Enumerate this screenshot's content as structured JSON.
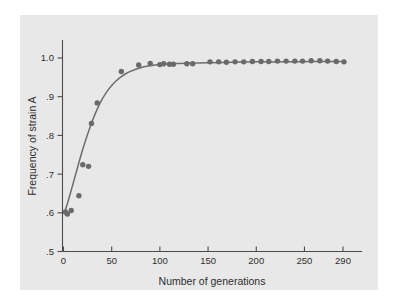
{
  "figure": {
    "background_color": "#ffffff",
    "panel_color": "#e8e8e8",
    "axis_color": "#4a4a4a",
    "point_color": "#6a6a6a",
    "curve_color": "#6d6d6d"
  },
  "chart_data": {
    "type": "scatter",
    "title": "",
    "subtitle": "",
    "xlabel": "Number of generations",
    "ylabel": "Frequency of strain A",
    "xlim": [
      0,
      300
    ],
    "ylim": [
      0.5,
      1.02
    ],
    "grid": false,
    "legend": null,
    "x_ticks": [
      0,
      50,
      100,
      150,
      200,
      250,
      290
    ],
    "x_tick_labels": [
      "0",
      "50",
      "100",
      "150",
      "200",
      "250",
      "290"
    ],
    "y_ticks": [
      0.5,
      0.6,
      0.7,
      0.8,
      0.9,
      1.0
    ],
    "y_tick_labels": [
      ".5",
      ".6",
      ".7",
      ".8",
      ".9",
      "1.0"
    ],
    "series": [
      {
        "name": "observed frequency",
        "marker": "circle",
        "color": "#6a6a6a",
        "points": [
          [
            2,
            0.602
          ],
          [
            4,
            0.597
          ],
          [
            8,
            0.606
          ],
          [
            16,
            0.644
          ],
          [
            20,
            0.724
          ],
          [
            26,
            0.72
          ],
          [
            29,
            0.831
          ],
          [
            35,
            0.884
          ],
          [
            60,
            0.965
          ],
          [
            78,
            0.982
          ],
          [
            90,
            0.986
          ],
          [
            100,
            0.983
          ],
          [
            104,
            0.985
          ],
          [
            110,
            0.984
          ],
          [
            114,
            0.984
          ],
          [
            128,
            0.985
          ],
          [
            134,
            0.985
          ],
          [
            152,
            0.99
          ],
          [
            161,
            0.99
          ],
          [
            169,
            0.989
          ],
          [
            178,
            0.99
          ],
          [
            187,
            0.99
          ],
          [
            196,
            0.991
          ],
          [
            205,
            0.991
          ],
          [
            213,
            0.991
          ],
          [
            222,
            0.992
          ],
          [
            231,
            0.992
          ],
          [
            240,
            0.992
          ],
          [
            248,
            0.992
          ],
          [
            257,
            0.993
          ],
          [
            266,
            0.993
          ],
          [
            274,
            0.992
          ],
          [
            283,
            0.991
          ],
          [
            291,
            0.99
          ]
        ]
      }
    ],
    "fit_curve": {
      "name": "theoretical selection curve",
      "color": "#6d6d6d",
      "points": [
        [
          1,
          0.6
        ],
        [
          5,
          0.632
        ],
        [
          10,
          0.676
        ],
        [
          15,
          0.721
        ],
        [
          20,
          0.764
        ],
        [
          25,
          0.803
        ],
        [
          30,
          0.838
        ],
        [
          35,
          0.868
        ],
        [
          40,
          0.893
        ],
        [
          45,
          0.913
        ],
        [
          50,
          0.929
        ],
        [
          55,
          0.942
        ],
        [
          60,
          0.952
        ],
        [
          65,
          0.96
        ],
        [
          70,
          0.966
        ],
        [
          75,
          0.971
        ],
        [
          80,
          0.975
        ],
        [
          85,
          0.978
        ],
        [
          90,
          0.98
        ],
        [
          95,
          0.982
        ],
        [
          100,
          0.983
        ],
        [
          110,
          0.985
        ],
        [
          120,
          0.986
        ],
        [
          135,
          0.987
        ],
        [
          150,
          0.988
        ],
        [
          175,
          0.989
        ],
        [
          200,
          0.99
        ],
        [
          230,
          0.99
        ],
        [
          260,
          0.991
        ],
        [
          292,
          0.991
        ]
      ]
    }
  }
}
